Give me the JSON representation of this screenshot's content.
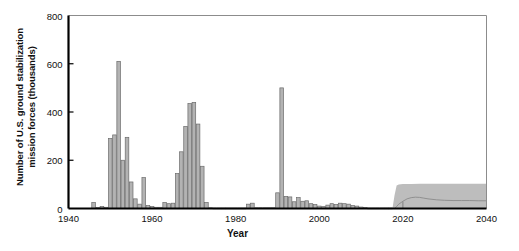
{
  "axes": {
    "ylabel_line1": "Number of U.S. ground stabilization",
    "ylabel_line2": "mission forces (thousands)",
    "xlabel": "Year",
    "yticks": [
      "0",
      "200",
      "400",
      "600",
      "800"
    ],
    "xticks": [
      "1940",
      "1960",
      "1980",
      "2000",
      "2020",
      "2040"
    ]
  },
  "colors": {
    "bar_fill": "#b3b3b3",
    "bar_stroke": "#6b6b6b",
    "band_fill": "#bdbdbd",
    "projection_line": "#8a8a8a",
    "axis": "#000000",
    "frame": "#8c8c8c",
    "text": "#111111"
  },
  "footnote": "",
  "chart_data": {
    "type": "bar",
    "title": "",
    "subtitle": "",
    "xlabel": "Year",
    "ylabel": "Number of U.S. ground stabilization mission forces (thousands)",
    "xlim": [
      1940,
      2040
    ],
    "ylim": [
      0,
      800
    ],
    "ytick_values": [
      0,
      200,
      400,
      600,
      800
    ],
    "xtick_values": [
      1940,
      1960,
      1980,
      2000,
      2020,
      2040
    ],
    "grid": false,
    "legend": "none",
    "series": [
      {
        "name": "Historical U.S. ground stabilization mission forces",
        "type": "bar",
        "x": [
          1940,
          1941,
          1942,
          1943,
          1944,
          1945,
          1946,
          1947,
          1948,
          1949,
          1950,
          1951,
          1952,
          1953,
          1954,
          1955,
          1956,
          1957,
          1958,
          1959,
          1960,
          1961,
          1962,
          1963,
          1964,
          1965,
          1966,
          1967,
          1968,
          1969,
          1970,
          1971,
          1972,
          1973,
          1974,
          1975,
          1976,
          1977,
          1978,
          1979,
          1980,
          1981,
          1982,
          1983,
          1984,
          1985,
          1986,
          1987,
          1988,
          1989,
          1990,
          1991,
          1992,
          1993,
          1994,
          1995,
          1996,
          1997,
          1998,
          1999,
          2000,
          2001,
          2002,
          2003,
          2004,
          2005,
          2006,
          2007,
          2008,
          2009,
          2010,
          2011,
          2012,
          2013,
          2014,
          2015,
          2016,
          2017
        ],
        "values": [
          0,
          0,
          0,
          0,
          0,
          0,
          25,
          4,
          8,
          5,
          290,
          305,
          610,
          200,
          295,
          110,
          40,
          18,
          128,
          12,
          8,
          5,
          5,
          25,
          20,
          22,
          145,
          235,
          340,
          435,
          440,
          350,
          175,
          25,
          3,
          2,
          2,
          2,
          2,
          2,
          2,
          2,
          2,
          18,
          22,
          3,
          3,
          3,
          3,
          3,
          65,
          500,
          50,
          48,
          28,
          45,
          30,
          32,
          20,
          16,
          10,
          8,
          14,
          20,
          16,
          22,
          20,
          18,
          12,
          10,
          6,
          4,
          2,
          2,
          2,
          2,
          2,
          2
        ]
      },
      {
        "name": "Projected range (shaded band)",
        "type": "area",
        "x": [
          2017.5,
          2018.0,
          2018.5,
          2019,
          2020,
          2022,
          2024,
          2026,
          2028,
          2030,
          2032,
          2034,
          2036,
          2038,
          2040
        ],
        "lower": [
          0,
          0,
          0,
          0,
          0,
          0,
          0,
          0,
          0,
          0,
          0,
          0,
          0,
          0,
          0
        ],
        "upper": [
          0,
          55,
          95,
          100,
          102,
          102,
          103,
          103,
          103,
          103,
          103,
          103,
          103,
          103,
          103
        ]
      },
      {
        "name": "Projected central estimate (line)",
        "type": "line",
        "x": [
          2018,
          2018.5,
          2019,
          2020,
          2021,
          2022,
          2023,
          2024,
          2025,
          2026,
          2028,
          2030,
          2032,
          2034,
          2036,
          2038,
          2040
        ],
        "values": [
          0,
          8,
          18,
          30,
          40,
          45,
          47,
          46,
          43,
          40,
          36,
          34,
          33,
          33,
          33,
          32,
          32
        ]
      }
    ],
    "annotations": [
      {
        "label": "Korean War peak",
        "x": 1952,
        "y": 610
      },
      {
        "label": "Vietnam War peak",
        "x": 1970,
        "y": 440
      },
      {
        "label": "Gulf War peak",
        "x": 1991,
        "y": 500
      },
      {
        "label": "Projection begins",
        "x": 2018,
        "y": 0
      }
    ]
  }
}
